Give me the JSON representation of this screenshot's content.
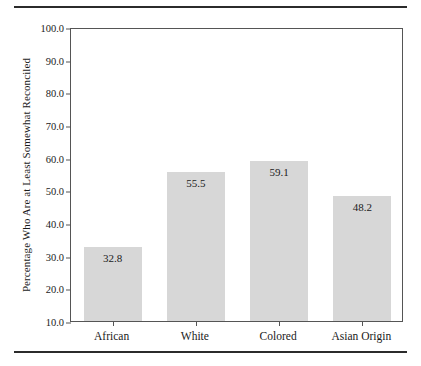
{
  "chart_data": {
    "type": "bar",
    "title": "",
    "subtitle": "",
    "xlabel": "",
    "ylabel": "Percentage Who Are at Least Somewhat Reconciled",
    "categories": [
      "African",
      "White",
      "Colored",
      "Asian Origin"
    ],
    "values": [
      32.8,
      55.5,
      59.1,
      48.2
    ],
    "value_labels": [
      "32.8",
      "55.5",
      "59.1",
      "48.2"
    ],
    "ylim": [
      10.0,
      100.0
    ],
    "ytick_labels": [
      "100.0",
      "90.0",
      "80.0",
      "70.0",
      "60.0",
      "50.0",
      "40.0",
      "30.0",
      "20.0",
      "10.0"
    ],
    "ytick_values": [
      100.0,
      90.0,
      80.0,
      70.0,
      60.0,
      50.0,
      40.0,
      30.0,
      20.0,
      10.0
    ],
    "grid": false,
    "legend": null,
    "legend_position": "none",
    "bar_color": "#d7d7d7",
    "axis_color": "#555555",
    "text_color": "#1a1a1a",
    "rule_color": "#2b2b2b"
  }
}
